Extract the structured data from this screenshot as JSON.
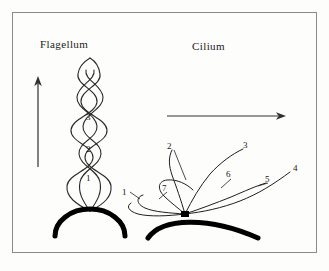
{
  "figure": {
    "background_color": "#fdfdfb",
    "border_color": "#8a8a8a",
    "stroke_color": "#1a1a1a",
    "membrane_color": "#000000"
  },
  "panels": [
    {
      "id": "flagellum",
      "title": "Flagellum",
      "motion_arrow": {
        "name": "upward-motion-arrow",
        "direction": "up"
      },
      "labels": [
        {
          "text": "3"
        },
        {
          "text": "2"
        },
        {
          "text": "1"
        }
      ]
    },
    {
      "id": "cilium",
      "title": "Cilium",
      "motion_arrow": {
        "name": "rightward-motion-arrow",
        "direction": "right"
      },
      "labels": [
        {
          "text": "1"
        },
        {
          "text": "2"
        },
        {
          "text": "3"
        },
        {
          "text": "4"
        },
        {
          "text": "5"
        },
        {
          "text": "6"
        },
        {
          "text": "7"
        }
      ]
    }
  ]
}
